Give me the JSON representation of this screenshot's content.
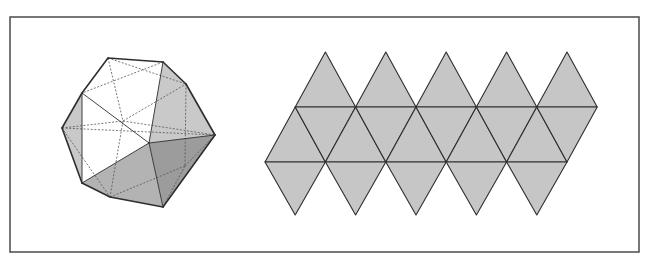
{
  "figure": {
    "frame": {
      "x": 10,
      "y": 17,
      "width": 629,
      "height": 235,
      "stroke": "#555555"
    },
    "colors": {
      "line": "#2e2e2e",
      "hidden_line": "#555555",
      "white_face": "#ffffff",
      "light_face": "#c9c9c9",
      "mid_face": "#b3b3b3",
      "dark_face": "#9c9c9c",
      "net_fill": "#c6c6c6"
    },
    "icosahedron": {
      "vertices": {
        "A": [
          108,
          58
        ],
        "B": [
          163,
          62
        ],
        "C": [
          186,
          84
        ],
        "D": [
          82,
          93
        ],
        "E": [
          62,
          128
        ],
        "F": [
          215,
          135
        ],
        "G": [
          149,
          143
        ],
        "H": [
          82,
          183
        ],
        "J": [
          110,
          197
        ],
        "I": [
          163,
          207
        ],
        "Q": [
          123,
          121
        ],
        "K": [
          185,
          166
        ]
      },
      "visible_faces": [
        {
          "pts": [
            "A",
            "B",
            "G",
            "D"
          ],
          "shade": "white_face"
        },
        {
          "pts": [
            "D",
            "G",
            "H"
          ],
          "shade": "white_face"
        },
        {
          "pts": [
            "D",
            "E",
            "H"
          ],
          "shade": "light_face"
        },
        {
          "pts": [
            "B",
            "C",
            "F",
            "G"
          ],
          "shade": "light_face"
        },
        {
          "pts": [
            "G",
            "F",
            "I"
          ],
          "shade": "dark_face"
        },
        {
          "pts": [
            "H",
            "G",
            "I",
            "J"
          ],
          "shade": "mid_face"
        }
      ],
      "solid_edges": [
        [
          "A",
          "B"
        ],
        [
          "B",
          "C"
        ],
        [
          "C",
          "F"
        ],
        [
          "F",
          "I"
        ],
        [
          "I",
          "J"
        ],
        [
          "J",
          "H"
        ],
        [
          "H",
          "E"
        ],
        [
          "E",
          "D"
        ],
        [
          "D",
          "A"
        ],
        [
          "D",
          "G"
        ],
        [
          "D",
          "H"
        ],
        [
          "B",
          "G"
        ],
        [
          "G",
          "F"
        ],
        [
          "G",
          "I"
        ],
        [
          "G",
          "H"
        ]
      ],
      "hidden_edges": [
        [
          "A",
          "Q"
        ],
        [
          "B",
          "D"
        ],
        [
          "E",
          "Q"
        ],
        [
          "Q",
          "F"
        ],
        [
          "Q",
          "J"
        ],
        [
          "E",
          "J"
        ],
        [
          "C",
          "K"
        ],
        [
          "K",
          "I"
        ],
        [
          "K",
          "J"
        ],
        [
          "K",
          "F"
        ],
        [
          "Q",
          "C"
        ],
        [
          "A",
          "C"
        ],
        [
          "E",
          "F"
        ]
      ]
    },
    "net": {
      "origin_x": 265,
      "side": 60.4,
      "rows_y": [
        52,
        107,
        162,
        215
      ],
      "columns": 5
    }
  }
}
